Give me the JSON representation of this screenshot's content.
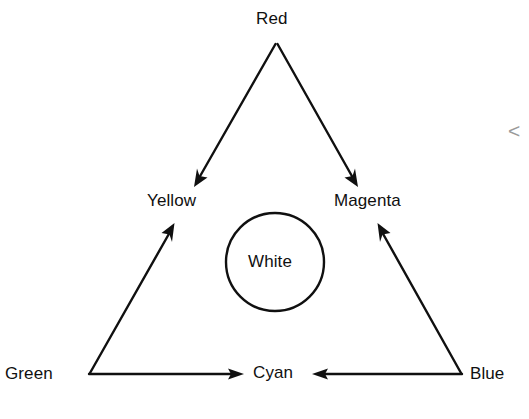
{
  "diagram": {
    "background_color": "#ffffff",
    "stroke_color": "#101010",
    "text_color": "#101010",
    "vertices": [
      {
        "id": "red",
        "label": "Red",
        "position": "top"
      },
      {
        "id": "green",
        "label": "Green",
        "position": "bottom-left"
      },
      {
        "id": "blue",
        "label": "Blue",
        "position": "bottom-right"
      }
    ],
    "edge_labels": [
      {
        "id": "yellow",
        "label": "Yellow",
        "position": "left-edge-midpoint"
      },
      {
        "id": "magenta",
        "label": "Magenta",
        "position": "right-edge-midpoint"
      },
      {
        "id": "cyan",
        "label": "Cyan",
        "position": "bottom-edge-midpoint"
      }
    ],
    "center": {
      "id": "white",
      "label": "White",
      "shape": "circle"
    },
    "arrows": [
      {
        "id": "red-to-yellow",
        "from": "Red",
        "to": "Yellow",
        "direction": "down-left"
      },
      {
        "id": "red-to-magenta",
        "from": "Red",
        "to": "Magenta",
        "direction": "down-right"
      },
      {
        "id": "green-to-yellow",
        "from": "Green",
        "to": "Yellow",
        "direction": "up-right"
      },
      {
        "id": "green-to-cyan",
        "from": "Green",
        "to": "Cyan",
        "direction": "right"
      },
      {
        "id": "blue-to-magenta",
        "from": "Blue",
        "to": "Magenta",
        "direction": "up-left"
      },
      {
        "id": "blue-to-cyan",
        "from": "Blue",
        "to": "Cyan",
        "direction": "left"
      }
    ],
    "margin_mark": "<"
  }
}
